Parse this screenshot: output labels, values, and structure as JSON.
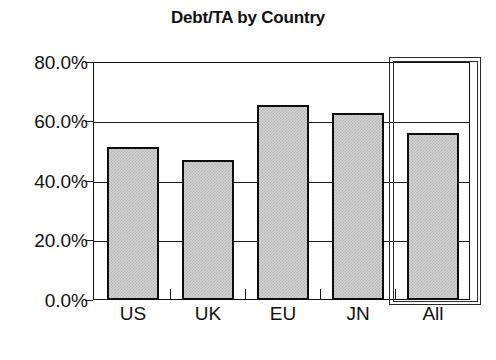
{
  "chart_data": {
    "type": "bar",
    "title": "Debt/TA by Country",
    "xlabel": "",
    "ylabel": "",
    "categories": [
      "US",
      "UK",
      "EU",
      "JN",
      "All"
    ],
    "values": [
      51.4,
      47.1,
      65.5,
      62.9,
      56.1
    ],
    "series": [
      {
        "name": "Debt/TA",
        "values": [
          51.4,
          47.1,
          65.5,
          62.9,
          56.1
        ]
      }
    ],
    "ylim": [
      0,
      80
    ],
    "y_tick_values": [
      0,
      20,
      40,
      60,
      80
    ],
    "y_tick_labels": [
      "0.0%",
      "20.0%",
      "40.0%",
      "60.0%",
      "80.0%"
    ],
    "grid": true,
    "grid_axis": "y",
    "legend": false,
    "legend_position": "none",
    "bar_fill_color": "#d2d2d2",
    "bar_edge_color": "#0d0d0d",
    "bar_fill_pattern": "fine-checkerboard-dither",
    "axis_color": "#111111",
    "background_color": "#ffffff",
    "annotations": [
      {
        "name": "selection-box",
        "shape": "double-line-rectangle",
        "target_category": "All",
        "color": "#2b2b2b"
      }
    ]
  },
  "axes": {
    "y_ticks": [
      {
        "label": "80.0%",
        "value": 80
      },
      {
        "label": "60.0%",
        "value": 60
      },
      {
        "label": "40.0%",
        "value": 40
      },
      {
        "label": "20.0%",
        "value": 20
      },
      {
        "label": "0.0%",
        "value": 0
      }
    ],
    "x_ticks": [
      {
        "label": "US",
        "value": 51.4
      },
      {
        "label": "UK",
        "value": 47.1
      },
      {
        "label": "EU",
        "value": 65.5
      },
      {
        "label": "JN",
        "value": 62.9
      },
      {
        "label": "All",
        "value": 56.1
      }
    ]
  }
}
